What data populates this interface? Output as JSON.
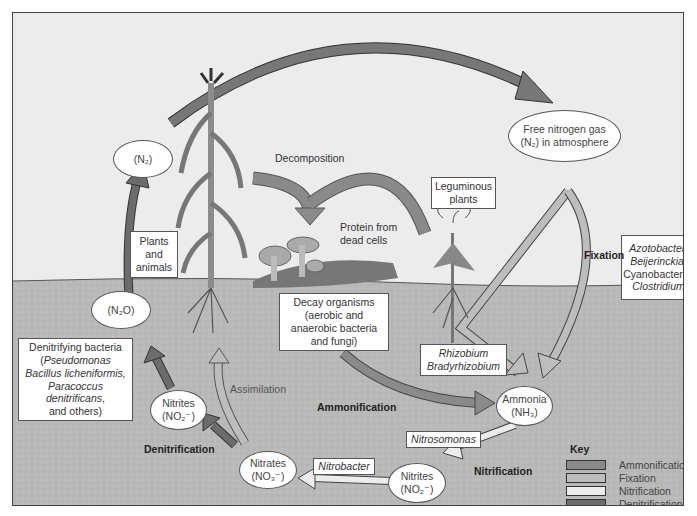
{
  "diagram": {
    "regions": [
      "atmosphere",
      "soil"
    ],
    "colors": {
      "sky": "#ececec",
      "soil": "#b9b9b9",
      "ammonification": "#8a8a8a",
      "fixation": "#bdbdbd",
      "nitrification": "#e6e6e6",
      "denitrification": "#6c6c6c"
    },
    "nodes": {
      "n2_left": {
        "line1": "(N₂)"
      },
      "free_nitrogen": {
        "line1": "Free nitrogen gas",
        "line2": "(N₂) in atmosphere"
      },
      "n2o": {
        "line1": "(N₂O)"
      },
      "nitrites_left": {
        "line1": "Nitrites",
        "line2": "(NO₂⁻)"
      },
      "nitrates": {
        "line1": "Nitrates",
        "line2": "(NO₃⁻)"
      },
      "nitrites_right": {
        "line1": "Nitrites",
        "line2": "(NO₂⁻)"
      },
      "ammonia": {
        "line1": "Ammonia",
        "line2": "(NH₃)"
      }
    },
    "boxes": {
      "plants_animals": {
        "line1": "Plants",
        "line2": "and",
        "line3": "animals"
      },
      "leguminous": {
        "line1": "Leguminous",
        "line2": "plants"
      },
      "fixers": {
        "line1": "Azotobacter,",
        "line2": "Beijerinckia,",
        "line3": "Cyanobacteria,",
        "line4": "Clostridium"
      },
      "decay": {
        "line1": "Decay organisms",
        "line2": "(aerobic and",
        "line3": "anaerobic bacteria",
        "line4": "and fungi)"
      },
      "rhizobium": {
        "line1": "Rhizobium",
        "line2": "Bradyrhizobium"
      },
      "denitrifying": {
        "line1": "Denitrifying bacteria",
        "line2_open": "(",
        "line2": "Pseudomonas",
        "line3": "Bacillus licheniformis,",
        "line4": "Paracoccus",
        "line5": "denitrificans",
        "line5_tail": ",",
        "line6": "and others)"
      },
      "nitrosomonas": {
        "line1": "Nitrosomonas"
      },
      "nitrobacter": {
        "line1": "Nitrobacter"
      }
    },
    "labels": {
      "decomposition": "Decomposition",
      "protein": {
        "line1": "Protein from",
        "line2": "dead cells"
      },
      "fixation": "Fixation",
      "assimilation": "Assimilation",
      "ammonification": "Ammonification",
      "denitrification": "Denitrification",
      "nitrification": "Nitrification"
    },
    "key": {
      "title": "Key",
      "items": [
        {
          "label": "Ammonification",
          "color": "#8a8a8a"
        },
        {
          "label": "Fixation",
          "color": "#bdbdbd"
        },
        {
          "label": "Nitrification",
          "color": "#ececec"
        },
        {
          "label": "Denitrification",
          "color": "#6c6c6c"
        }
      ]
    }
  }
}
